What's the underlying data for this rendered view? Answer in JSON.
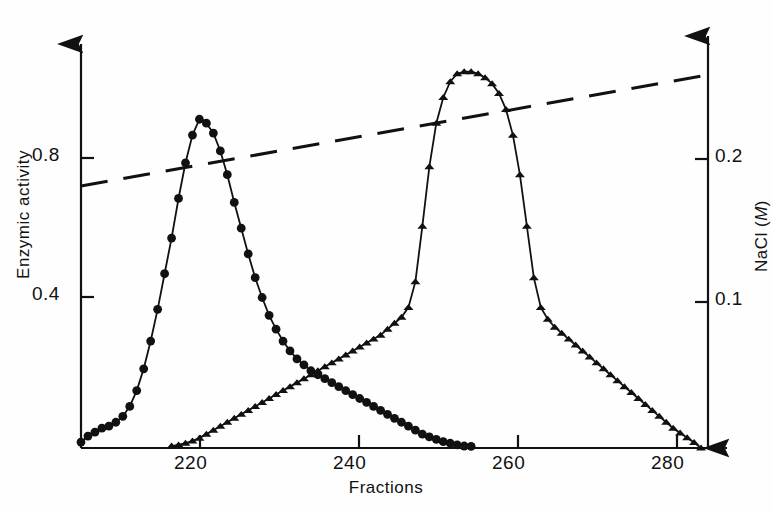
{
  "figure": {
    "background": "#fefefe",
    "ink": "#111111"
  },
  "chart_data": {
    "type": "line",
    "title": "",
    "xlabel": "Fractions",
    "ylabel": "Enzymic activity",
    "ylabel_right": "NaCl (M)",
    "grid": false,
    "legend": "none",
    "xlim": [
      201,
      291
    ],
    "ylim": [
      0.0,
      1.02
    ],
    "ylim_right": [
      0.0,
      0.255
    ],
    "xticks": [
      220,
      240,
      260,
      280
    ],
    "xticklabels": [
      "220",
      "240",
      "260",
      "280"
    ],
    "yticks": [
      0.4,
      0.8
    ],
    "yticklabels": [
      "0.4",
      "0.8"
    ],
    "yticks_right": [
      0.1,
      0.2
    ],
    "yticklabels_right": [
      "0.1",
      "0.2"
    ],
    "series": [
      {
        "name": "Enzymic activity peak 1",
        "marker": "circle",
        "axis": "left",
        "x": [
          201,
          202,
          203,
          204,
          205,
          206,
          207,
          208,
          209,
          210,
          211,
          212,
          213,
          214,
          215,
          216,
          217,
          218,
          219,
          220,
          221,
          222,
          223,
          224,
          225,
          226,
          227,
          228,
          229,
          230,
          231,
          232,
          233,
          234,
          235,
          236,
          237,
          238,
          239,
          240,
          241,
          242,
          243,
          244,
          245,
          246,
          247,
          248,
          249,
          250,
          251,
          252,
          253,
          254,
          255,
          256,
          257
        ],
        "y": [
          0.015,
          0.03,
          0.04,
          0.05,
          0.055,
          0.065,
          0.08,
          0.105,
          0.145,
          0.2,
          0.27,
          0.35,
          0.44,
          0.53,
          0.63,
          0.72,
          0.79,
          0.83,
          0.82,
          0.795,
          0.75,
          0.69,
          0.62,
          0.555,
          0.49,
          0.43,
          0.38,
          0.335,
          0.3,
          0.27,
          0.245,
          0.225,
          0.21,
          0.195,
          0.185,
          0.175,
          0.165,
          0.155,
          0.145,
          0.135,
          0.125,
          0.115,
          0.105,
          0.095,
          0.085,
          0.075,
          0.065,
          0.055,
          0.045,
          0.035,
          0.028,
          0.022,
          0.016,
          0.012,
          0.008,
          0.005,
          0.004
        ]
      },
      {
        "name": "Enzymic activity peak 2",
        "marker": "triangle",
        "axis": "left",
        "x": [
          214,
          215,
          216,
          217,
          218,
          219,
          220,
          221,
          222,
          223,
          224,
          225,
          226,
          227,
          228,
          229,
          230,
          231,
          232,
          233,
          234,
          235,
          236,
          237,
          238,
          239,
          240,
          241,
          242,
          243,
          244,
          245,
          246,
          247,
          248,
          249,
          250,
          251,
          252,
          253,
          254,
          255,
          256,
          257,
          258,
          259,
          260,
          261,
          262,
          263,
          264,
          265,
          266,
          267,
          268,
          269,
          270,
          271,
          272,
          273,
          274,
          275,
          276,
          277,
          278,
          279,
          280,
          281,
          282,
          283,
          284,
          285,
          286,
          287,
          288,
          289,
          290
        ],
        "y": [
          0.005,
          0.008,
          0.012,
          0.018,
          0.025,
          0.035,
          0.045,
          0.055,
          0.065,
          0.075,
          0.085,
          0.095,
          0.105,
          0.115,
          0.125,
          0.135,
          0.145,
          0.155,
          0.165,
          0.175,
          0.185,
          0.195,
          0.205,
          0.215,
          0.225,
          0.235,
          0.245,
          0.255,
          0.265,
          0.275,
          0.285,
          0.3,
          0.315,
          0.33,
          0.355,
          0.42,
          0.56,
          0.71,
          0.82,
          0.885,
          0.925,
          0.945,
          0.95,
          0.95,
          0.945,
          0.935,
          0.92,
          0.895,
          0.855,
          0.79,
          0.69,
          0.56,
          0.43,
          0.355,
          0.325,
          0.305,
          0.29,
          0.275,
          0.26,
          0.245,
          0.23,
          0.215,
          0.2,
          0.185,
          0.17,
          0.155,
          0.14,
          0.125,
          0.11,
          0.095,
          0.08,
          0.065,
          0.05,
          0.038,
          0.026,
          0.014,
          0.0
        ]
      },
      {
        "name": "NaCl gradient",
        "marker": "none",
        "style": "dashed",
        "axis": "right",
        "x": [
          201,
          291
        ],
        "y": [
          0.169,
          0.238
        ]
      }
    ],
    "annotations": []
  },
  "axes": {
    "x_axis_label": "Fractions",
    "y_axis_left_label": "Enzymic activity",
    "y_axis_right_label_text": "NaCl (",
    "y_axis_right_label_italic": "M",
    "y_axis_right_label_close": ")"
  }
}
